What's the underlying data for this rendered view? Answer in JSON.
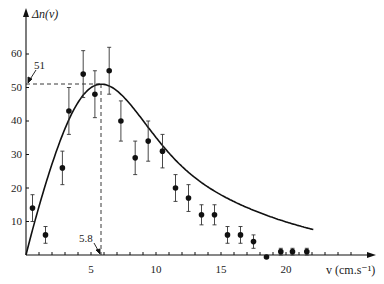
{
  "chart_data": {
    "type": "scatter",
    "title": "",
    "xlabel": "v (cm.s⁻¹)",
    "ylabel": "Δn(v)",
    "x_ticks": [
      5,
      10,
      15,
      20
    ],
    "y_ticks": [
      10,
      20,
      30,
      40,
      50,
      60
    ],
    "xlim": [
      0,
      23
    ],
    "ylim": [
      0,
      68
    ],
    "grid": false,
    "series": [
      {
        "name": "measured",
        "kind": "points_with_error_bars",
        "x": [
          0.5,
          1.5,
          2.8,
          3.3,
          4.4,
          5.3,
          6.4,
          7.3,
          8.4,
          9.4,
          10.5,
          11.5,
          12.5,
          13.5,
          14.5,
          15.5,
          16.5,
          17.5,
          18.5,
          19.6,
          20.5,
          21.6
        ],
        "y": [
          14,
          6,
          26,
          43,
          54,
          48,
          55,
          40,
          29,
          34,
          31,
          20,
          17,
          12,
          12,
          6,
          6,
          4,
          0,
          1,
          1,
          1
        ],
        "yerr": [
          4,
          2.5,
          5,
          7,
          7,
          7,
          7,
          6,
          5,
          6,
          5,
          4,
          4,
          3,
          3,
          2.5,
          2.5,
          2,
          0,
          1,
          1,
          1
        ]
      },
      {
        "name": "fit",
        "kind": "curve",
        "description": "Maxwell-like distribution fit through origin with peak at v=5.8, Δn=51"
      }
    ],
    "annotations": [
      {
        "text": "51",
        "type": "peak-value",
        "x": 0,
        "y": 51
      },
      {
        "text": "5.8",
        "type": "peak-position",
        "x": 5.8,
        "y": 0
      }
    ]
  },
  "labels": {
    "y_axis": "Δn(v)",
    "x_axis": "v (cm.s⁻¹)",
    "peak_y": "51",
    "peak_x": "5.8",
    "yticks": [
      "10",
      "20",
      "30",
      "40",
      "50",
      "60"
    ],
    "xticks": [
      "5",
      "10",
      "15",
      "20"
    ]
  }
}
